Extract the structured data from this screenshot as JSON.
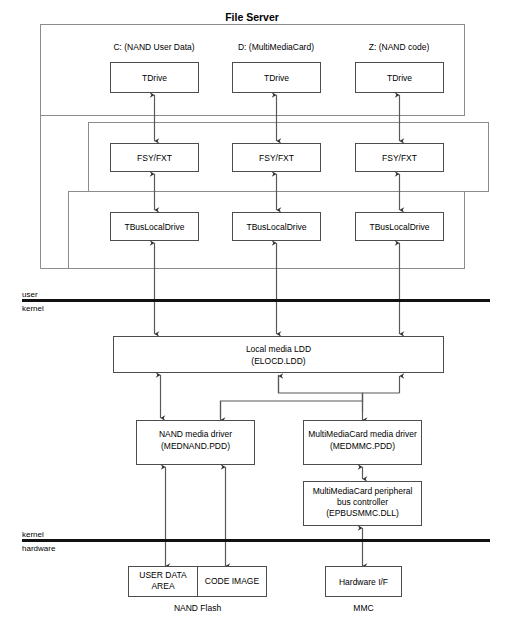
{
  "diagram": {
    "title": "File Server",
    "groups": {
      "file_server_label": "File Server",
      "fsy_group_label": "",
      "bus_group_label": ""
    },
    "drives": [
      {
        "caption": "C: (NAND User Data)",
        "tdrive": "TDrive",
        "fsy": "FSY/FXT",
        "bus": "TBusLocalDrive"
      },
      {
        "caption": "D: (MultiMediaCard)",
        "tdrive": "TDrive",
        "fsy": "FSY/FXT",
        "bus": "TBusLocalDrive"
      },
      {
        "caption": "Z: (NAND code)",
        "tdrive": "TDrive",
        "fsy": "FSY/FXT",
        "bus": "TBusLocalDrive"
      }
    ],
    "boundaries": [
      {
        "above": "user",
        "below": "kernel"
      },
      {
        "above": "kernel",
        "below": "hardware"
      }
    ],
    "ldd": {
      "line1": "Local media LDD",
      "line2": "(ELOCD.LDD)"
    },
    "nand_driver": {
      "line1": "NAND media driver",
      "line2": "(MEDNAND.PDD)"
    },
    "mmc_driver": {
      "line1": "MultiMediaCard media driver",
      "line2": "(MEDMMC.PDD)"
    },
    "mmc_bus": {
      "line1": "MultiMediaCard peripheral",
      "line2": "bus controller",
      "line3": "(EPBUSMMC.DLL)"
    },
    "nand_flash": {
      "user_data_line1": "USER DATA",
      "user_data_line2": "AREA",
      "code_image": "CODE IMAGE",
      "caption": "NAND Flash"
    },
    "mmc_hw": {
      "label": "Hardware I/F",
      "caption": "MMC"
    },
    "colors": {
      "box_stroke": "#4d4d4d",
      "group_stroke": "#8c8c8c",
      "connector": "#595959",
      "divider": "#111111",
      "background": "#ffffff",
      "text": "#000000"
    }
  }
}
